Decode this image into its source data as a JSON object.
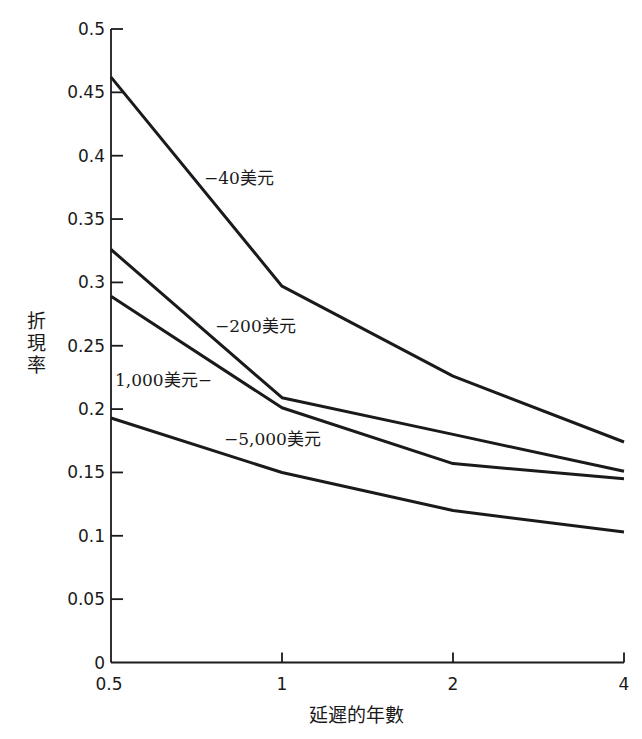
{
  "chart_data": {
    "type": "line",
    "title": "",
    "xlabel": "延遲的年數",
    "ylabel": "折現率",
    "categories": [
      "0.5",
      "1",
      "2",
      "4"
    ],
    "ylim": [
      0,
      0.5
    ],
    "yticks": [
      "0",
      "0.05",
      "0.1",
      "0.15",
      "0.2",
      "0.25",
      "0.3",
      "0.35",
      "0.4",
      "0.45",
      "0.5"
    ],
    "ytick_values": [
      0,
      0.05,
      0.1,
      0.15,
      0.2,
      0.25,
      0.3,
      0.35,
      0.4,
      0.45,
      0.5
    ],
    "grid": false,
    "legend": "inline labels",
    "series": [
      {
        "name": "−40美元",
        "values": [
          0.462,
          0.297,
          0.226,
          0.174
        ]
      },
      {
        "name": "−200美元",
        "values": [
          0.326,
          0.209,
          0.18,
          0.151
        ]
      },
      {
        "name": "1,000美元−",
        "values": [
          0.289,
          0.201,
          0.157,
          0.145
        ]
      },
      {
        "name": "−5,000美元",
        "values": [
          0.193,
          0.15,
          0.12,
          0.103
        ]
      }
    ]
  }
}
